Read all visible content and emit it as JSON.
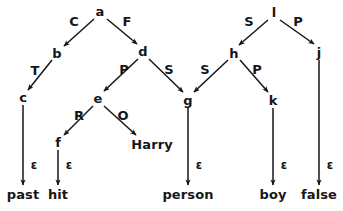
{
  "diagram": {
    "type": "dependency-tree",
    "background_color": "#ffffff",
    "ink_color": "#161616",
    "nodes": [
      {
        "id": "a",
        "label": "a",
        "x": 100,
        "y": 11,
        "kind": "node"
      },
      {
        "id": "b",
        "label": "b",
        "x": 57,
        "y": 53,
        "kind": "node"
      },
      {
        "id": "c",
        "label": "c",
        "x": 23,
        "y": 97,
        "kind": "node"
      },
      {
        "id": "d",
        "label": "d",
        "x": 143,
        "y": 51,
        "kind": "node"
      },
      {
        "id": "e",
        "label": "e",
        "x": 98,
        "y": 98,
        "kind": "node"
      },
      {
        "id": "f",
        "label": "f",
        "x": 58,
        "y": 142,
        "kind": "node"
      },
      {
        "id": "g",
        "label": "g",
        "x": 188,
        "y": 100,
        "kind": "node"
      },
      {
        "id": "h",
        "label": "h",
        "x": 234,
        "y": 53,
        "kind": "node"
      },
      {
        "id": "k",
        "label": "k",
        "x": 273,
        "y": 100,
        "kind": "node"
      },
      {
        "id": "l",
        "label": "l",
        "x": 274,
        "y": 12,
        "kind": "node"
      },
      {
        "id": "j",
        "label": "j",
        "x": 319,
        "y": 52,
        "kind": "node"
      },
      {
        "id": "Harry",
        "label": "Harry",
        "x": 152,
        "y": 144,
        "kind": "leaf"
      },
      {
        "id": "past",
        "label": "past",
        "x": 23,
        "y": 194,
        "kind": "leaf"
      },
      {
        "id": "hit",
        "label": "hit",
        "x": 58,
        "y": 194,
        "kind": "leaf"
      },
      {
        "id": "person",
        "label": "person",
        "x": 188,
        "y": 194,
        "kind": "leaf"
      },
      {
        "id": "boy",
        "label": "boy",
        "x": 273,
        "y": 194,
        "kind": "leaf"
      },
      {
        "id": "false",
        "label": "false",
        "x": 319,
        "y": 194,
        "kind": "leaf"
      }
    ],
    "edges": [
      {
        "from": "a",
        "to": "b",
        "label": "C",
        "label_x": 74,
        "label_y": 21,
        "x1": 94,
        "y1": 19,
        "x2": 64,
        "y2": 46
      },
      {
        "from": "a",
        "to": "d",
        "label": "F",
        "label_x": 127,
        "label_y": 21,
        "x1": 107,
        "y1": 19,
        "x2": 137,
        "y2": 44
      },
      {
        "from": "b",
        "to": "c",
        "label": "T",
        "label_x": 35,
        "label_y": 70,
        "x1": 52,
        "y1": 60,
        "x2": 28,
        "y2": 90
      },
      {
        "from": "d",
        "to": "e",
        "label": "P",
        "label_x": 124,
        "label_y": 69,
        "x1": 138,
        "y1": 59,
        "x2": 104,
        "y2": 91
      },
      {
        "from": "d",
        "to": "g",
        "label": "S",
        "label_x": 169,
        "label_y": 69,
        "x1": 149,
        "y1": 59,
        "x2": 183,
        "y2": 92
      },
      {
        "from": "e",
        "to": "f",
        "label": "R",
        "label_x": 79,
        "label_y": 115,
        "x1": 93,
        "y1": 106,
        "x2": 64,
        "y2": 135
      },
      {
        "from": "e",
        "to": "Harry",
        "label": "O",
        "label_x": 123,
        "label_y": 115,
        "x1": 104,
        "y1": 106,
        "x2": 136,
        "y2": 135
      },
      {
        "from": "h",
        "to": "g",
        "label": "S",
        "label_x": 205,
        "label_y": 69,
        "x1": 228,
        "y1": 60,
        "x2": 194,
        "y2": 92
      },
      {
        "from": "h",
        "to": "k",
        "label": "P",
        "label_x": 257,
        "label_y": 69,
        "x1": 240,
        "y1": 60,
        "x2": 268,
        "y2": 92
      },
      {
        "from": "l",
        "to": "h",
        "label": "S",
        "label_x": 249,
        "label_y": 21,
        "x1": 268,
        "y1": 20,
        "x2": 239,
        "y2": 45
      },
      {
        "from": "l",
        "to": "j",
        "label": "P",
        "label_x": 298,
        "label_y": 21,
        "x1": 280,
        "y1": 20,
        "x2": 314,
        "y2": 44
      },
      {
        "from": "c",
        "to": "past",
        "label": "ε",
        "label_x": 34,
        "label_y": 166,
        "x1": 23,
        "y1": 105,
        "x2": 23,
        "y2": 185
      },
      {
        "from": "f",
        "to": "hit",
        "label": "ε",
        "label_x": 69,
        "label_y": 166,
        "x1": 58,
        "y1": 150,
        "x2": 58,
        "y2": 185
      },
      {
        "from": "g",
        "to": "person",
        "label": "ε",
        "label_x": 199,
        "label_y": 166,
        "x1": 188,
        "y1": 108,
        "x2": 188,
        "y2": 185
      },
      {
        "from": "k",
        "to": "boy",
        "label": "ε",
        "label_x": 284,
        "label_y": 166,
        "x1": 273,
        "y1": 108,
        "x2": 273,
        "y2": 185
      },
      {
        "from": "j",
        "to": "false",
        "label": "ε",
        "label_x": 330,
        "label_y": 166,
        "x1": 319,
        "y1": 60,
        "x2": 319,
        "y2": 185
      }
    ]
  }
}
